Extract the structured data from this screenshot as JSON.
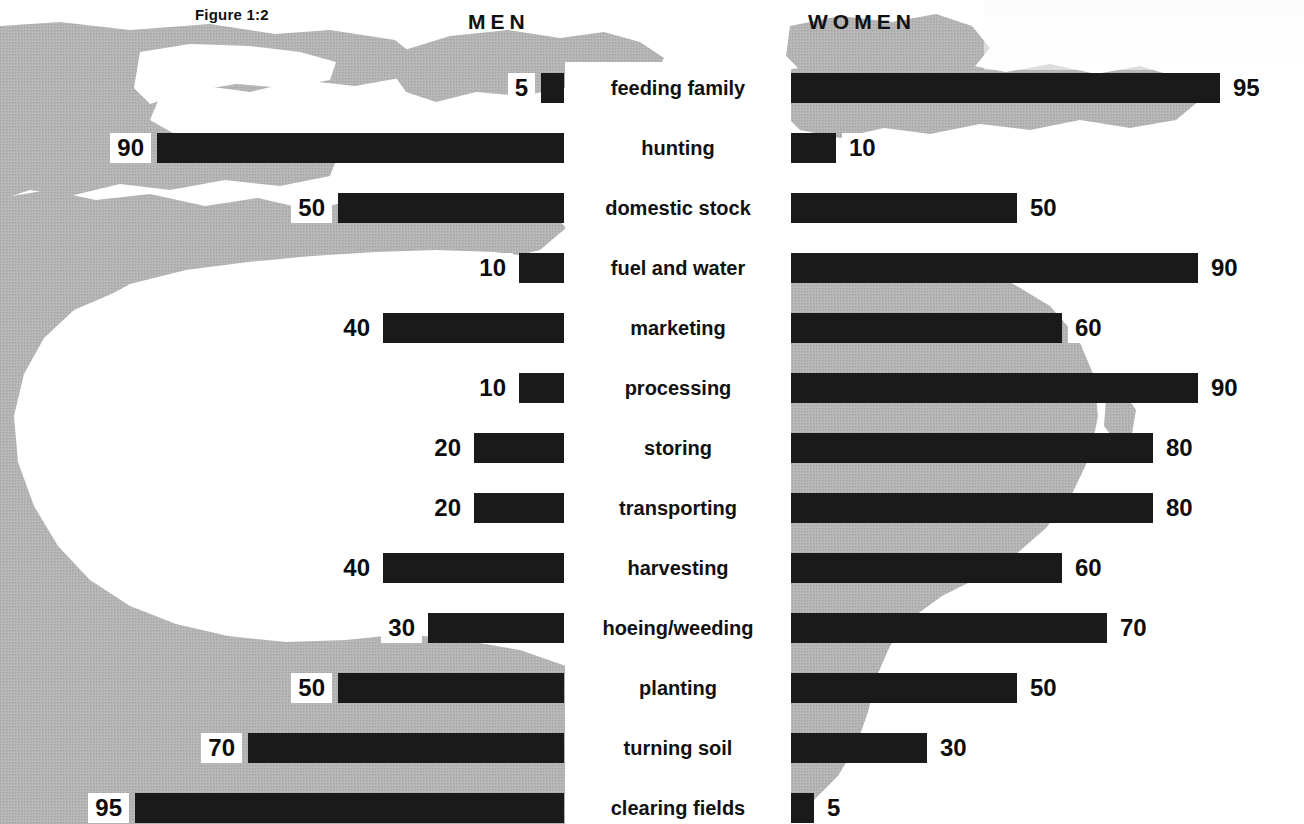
{
  "figure": {
    "label": "Figure 1:2"
  },
  "headings": {
    "left": "MEN",
    "right": "WOMEN"
  },
  "colors": {
    "bar": "#1a1a1a",
    "map_gray": "#b4b4b4",
    "background": "#ffffff",
    "text": "#111111"
  },
  "chart_data": {
    "type": "bar",
    "orientation": "horizontal",
    "style": "diverging-bidirectional-pyramid",
    "title": "Figure 1:2",
    "xlabel": "",
    "ylabel": "",
    "xlim": [
      0,
      100
    ],
    "grid": false,
    "legend_position": "top (column headings)",
    "units": "percent",
    "categories": [
      "feeding family",
      "hunting",
      "domestic stock",
      "fuel and water",
      "marketing",
      "processing",
      "storing",
      "transporting",
      "harvesting",
      "hoeing/weeding",
      "planting",
      "turning soil",
      "clearing fields"
    ],
    "series": [
      {
        "name": "MEN",
        "side": "left",
        "values": [
          5,
          90,
          50,
          10,
          40,
          10,
          20,
          20,
          40,
          30,
          50,
          70,
          95
        ]
      },
      {
        "name": "WOMEN",
        "side": "right",
        "values": [
          95,
          10,
          50,
          90,
          60,
          90,
          80,
          80,
          60,
          70,
          50,
          30,
          5
        ]
      }
    ],
    "rows": [
      {
        "category": "feeding family",
        "men": 5,
        "women": 95
      },
      {
        "category": "hunting",
        "men": 90,
        "women": 10
      },
      {
        "category": "domestic stock",
        "men": 50,
        "women": 50
      },
      {
        "category": "fuel and water",
        "men": 10,
        "women": 90
      },
      {
        "category": "marketing",
        "men": 40,
        "women": 60
      },
      {
        "category": "processing",
        "men": 10,
        "women": 90
      },
      {
        "category": "storing",
        "men": 20,
        "women": 80
      },
      {
        "category": "transporting",
        "men": 20,
        "women": 80
      },
      {
        "category": "harvesting",
        "men": 40,
        "women": 60
      },
      {
        "category": "hoeing/weeding",
        "men": 30,
        "women": 70
      },
      {
        "category": "planting",
        "men": 50,
        "women": 50
      },
      {
        "category": "turning soil",
        "men": 70,
        "women": 30
      },
      {
        "category": "clearing fields",
        "men": 95,
        "women": 5
      }
    ]
  },
  "layout": {
    "left_baseline_x": 564,
    "right_baseline_x": 791,
    "row_height": 30,
    "row_pitch": 60,
    "first_row_top": 73,
    "left_max_bar_px": 452,
    "right_max_bar_px": 452
  }
}
